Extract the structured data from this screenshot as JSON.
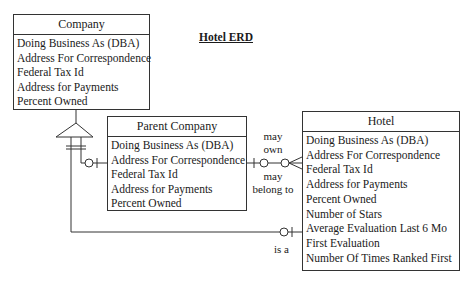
{
  "diagram": {
    "title": "Hotel ERD",
    "type": "entity-relationship",
    "entities": [
      {
        "id": "company",
        "name": "Company",
        "attributes": [
          "Doing Business As (DBA)",
          "Address For Correspondence",
          "Federal Tax Id",
          "Address for Payments",
          "Percent Owned"
        ]
      },
      {
        "id": "parent",
        "name": "Parent Company",
        "attributes": [
          "Doing Business As (DBA)",
          "Address For Correspondence",
          "Federal Tax Id",
          "Address for Payments",
          "Percent Owned"
        ]
      },
      {
        "id": "hotel",
        "name": "Hotel",
        "attributes": [
          "Doing Business As (DBA)",
          "Address For Correspondence",
          "Federal Tax Id",
          "Address for Payments",
          "Percent Owned",
          "Number of Stars",
          "Average Evaluation Last 6 Mo",
          "First Evaluation",
          "Number Of Times Ranked First"
        ]
      }
    ],
    "relationships": [
      {
        "from": "Company",
        "to": [
          "Parent Company",
          "Hotel"
        ],
        "kind": "subtype",
        "symbol": "triangle"
      },
      {
        "from": "Company",
        "to": "Parent Company",
        "cardinality": "zero-or-one",
        "label": ""
      },
      {
        "from": "Company",
        "to": "Hotel",
        "cardinality": "zero-or-one",
        "label": "is a"
      },
      {
        "from": "Parent Company",
        "to": "Hotel",
        "cardinality": "zero-or-many",
        "label_top": "may own",
        "label_top_lines": [
          "may",
          "own"
        ],
        "label_bottom": "may belong to",
        "label_bottom_lines": [
          "may",
          "belong to"
        ]
      }
    ]
  },
  "colors": {
    "line": "#333333",
    "background": "#ffffff",
    "text": "#1a1a1a"
  }
}
